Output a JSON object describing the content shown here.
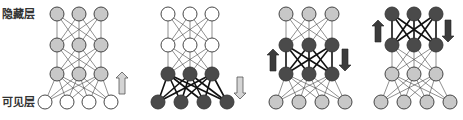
{
  "labels": {
    "hidden": "隐藏层",
    "visible": "可见层"
  },
  "colors": {
    "white": "#ffffff",
    "light": "#c8c8c8",
    "dark": "#4a4a4a",
    "stroke": "#333333",
    "edge_thin": "#444444",
    "edge_thick": "#111111",
    "arrow_light_fill": "#d4d4d4",
    "arrow_dark_fill": "#3c3c3c"
  },
  "layout": {
    "radius": 7,
    "hidden_rows_y": [
      14,
      45,
      74
    ],
    "visible_row_y": 102
  },
  "panels": [
    {
      "name": "panel-1-bottom-up-pretrain",
      "hidden_x": [
        57,
        79,
        101
      ],
      "visible_x": [
        45,
        67,
        89,
        111
      ],
      "row_fills": [
        "light",
        "light",
        "light",
        "white"
      ],
      "thick_edges_between": null,
      "arrows": [
        {
          "x": 122,
          "y": 83,
          "dir": "up",
          "style": "light"
        }
      ]
    },
    {
      "name": "panel-2-top-down-reconstruct",
      "hidden_x": [
        168,
        190,
        212
      ],
      "visible_x": [
        158,
        181,
        204,
        227
      ],
      "row_fills": [
        "white",
        "white",
        "dark",
        "dark"
      ],
      "thick_edges_between": [
        2,
        3
      ],
      "arrows": [
        {
          "x": 240,
          "y": 88,
          "dir": "down",
          "style": "light"
        }
      ]
    },
    {
      "name": "panel-3-middle-layers",
      "hidden_x": [
        286,
        309,
        332
      ],
      "visible_x": [
        276,
        299,
        322,
        345
      ],
      "row_fills": [
        "light",
        "dark",
        "dark",
        "light"
      ],
      "thick_edges_between": [
        1,
        2
      ],
      "arrows": [
        {
          "x": 273,
          "y": 60,
          "dir": "up",
          "style": "dark"
        },
        {
          "x": 345,
          "y": 60,
          "dir": "down",
          "style": "dark"
        }
      ]
    },
    {
      "name": "panel-4-top-layers",
      "hidden_x": [
        392,
        414,
        436
      ],
      "visible_x": [
        381,
        404,
        427,
        450
      ],
      "row_fills": [
        "dark",
        "dark",
        "light",
        "light"
      ],
      "thick_edges_between": [
        0,
        1
      ],
      "arrows": [
        {
          "x": 378,
          "y": 31,
          "dir": "up",
          "style": "dark"
        },
        {
          "x": 448,
          "y": 31,
          "dir": "down",
          "style": "dark"
        }
      ]
    }
  ]
}
